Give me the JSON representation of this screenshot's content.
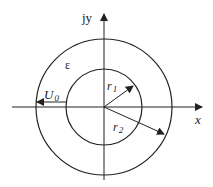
{
  "diagram": {
    "colors": {
      "stroke": "#222222",
      "background": "#ffffff"
    },
    "axes": {
      "x_label": "x",
      "y_label": "jy"
    },
    "region_label": "ε",
    "voltage_label": {
      "main": "U",
      "sub": "0"
    },
    "radius_labels": [
      {
        "main": "r",
        "sub": "1"
      },
      {
        "main": "r",
        "sub": "2"
      }
    ],
    "circles": [
      {
        "name": "inner",
        "radius_label": "r1"
      },
      {
        "name": "outer",
        "radius_label": "r2"
      }
    ]
  }
}
